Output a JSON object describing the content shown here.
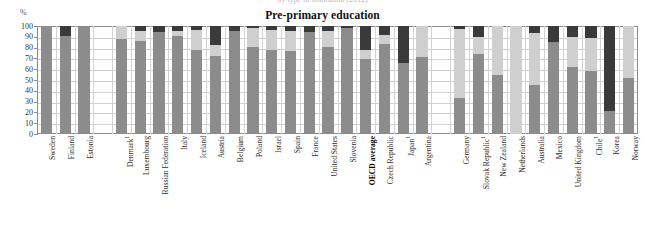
{
  "figure": {
    "top_caption_cutoff": "by type of institution (2012)",
    "title": "Pre-primary education",
    "y_axis_unit": "%"
  },
  "chart_data": {
    "type": "bar",
    "subtype": "stacked-bar",
    "title": "Pre-primary education",
    "xlabel": "",
    "ylabel": "%",
    "ylim": [
      0,
      100
    ],
    "yticks": [
      0,
      10,
      20,
      30,
      40,
      50,
      60,
      70,
      80,
      90,
      100
    ],
    "grid": true,
    "legend": null,
    "series": [
      {
        "name": "public-institutions",
        "color": "#8c8c8c"
      },
      {
        "name": "government-dependent-private",
        "color": "#cfcfcf"
      },
      {
        "name": "independent-private",
        "color": "#3a3a3a"
      }
    ],
    "categories": [
      "Sweden",
      "Finland",
      "Estonia",
      "Denmark",
      "Luxembourg",
      "Russian Federation",
      "Italy",
      "Iceland",
      "Austria",
      "Belgium",
      "Poland",
      "Israel",
      "Spain",
      "France",
      "United States",
      "Slovenia",
      "OECD average",
      "Czech Republic",
      "Japan",
      "Argentina",
      "Germany",
      "Slovak Republic",
      "New Zealand",
      "Netherlands",
      "Australia",
      "Mexico",
      "United Kingdom",
      "Chile",
      "Korea",
      "Norway"
    ],
    "category_footnotes": {
      "Denmark": "1",
      "Japan": "1",
      "Slovak Republic": "1",
      "Chile": "1"
    },
    "bold_categories": [
      "OECD average"
    ],
    "gap_after": [
      "Estonia",
      "Argentina"
    ],
    "values": [
      {
        "category": "Sweden",
        "public": 100,
        "gov_dependent_private": 0,
        "independent_private": 0
      },
      {
        "category": "Finland",
        "public": 91,
        "gov_dependent_private": 0,
        "independent_private": 9
      },
      {
        "category": "Estonia",
        "public": 100,
        "gov_dependent_private": 0,
        "independent_private": 0
      },
      {
        "category": "Denmark",
        "public": 88,
        "gov_dependent_private": 12,
        "independent_private": 0
      },
      {
        "category": "Luxembourg",
        "public": 86,
        "gov_dependent_private": 9,
        "independent_private": 5
      },
      {
        "category": "Russian Federation",
        "public": 94,
        "gov_dependent_private": 0,
        "independent_private": 6
      },
      {
        "category": "Italy",
        "public": 91,
        "gov_dependent_private": 4,
        "independent_private": 5
      },
      {
        "category": "Iceland",
        "public": 78,
        "gov_dependent_private": 18,
        "independent_private": 4
      },
      {
        "category": "Austria",
        "public": 72,
        "gov_dependent_private": 10,
        "independent_private": 18
      },
      {
        "category": "Belgium",
        "public": 95,
        "gov_dependent_private": 0,
        "independent_private": 5
      },
      {
        "category": "Poland",
        "public": 81,
        "gov_dependent_private": 17,
        "independent_private": 2
      },
      {
        "category": "Israel",
        "public": 78,
        "gov_dependent_private": 18,
        "independent_private": 4
      },
      {
        "category": "Spain",
        "public": 77,
        "gov_dependent_private": 18,
        "independent_private": 5
      },
      {
        "category": "France",
        "public": 94,
        "gov_dependent_private": 0,
        "independent_private": 6
      },
      {
        "category": "United States",
        "public": 81,
        "gov_dependent_private": 14,
        "independent_private": 5
      },
      {
        "category": "Slovenia",
        "public": 98,
        "gov_dependent_private": 0,
        "independent_private": 2
      },
      {
        "category": "OECD average",
        "public": 69,
        "gov_dependent_private": 9,
        "independent_private": 22
      },
      {
        "category": "Czech Republic",
        "public": 83,
        "gov_dependent_private": 9,
        "independent_private": 8
      },
      {
        "category": "Japan",
        "public": 66,
        "gov_dependent_private": 0,
        "independent_private": 34
      },
      {
        "category": "Argentina",
        "public": 71,
        "gov_dependent_private": 29,
        "independent_private": 0
      },
      {
        "category": "Germany",
        "public": 33,
        "gov_dependent_private": 64,
        "independent_private": 3
      },
      {
        "category": "Slovak Republic",
        "public": 74,
        "gov_dependent_private": 16,
        "independent_private": 10
      },
      {
        "category": "New Zealand",
        "public": 55,
        "gov_dependent_private": 45,
        "independent_private": 0
      },
      {
        "category": "Netherlands",
        "public": 0,
        "gov_dependent_private": 100,
        "independent_private": 0
      },
      {
        "category": "Australia",
        "public": 45,
        "gov_dependent_private": 49,
        "independent_private": 6
      },
      {
        "category": "Mexico",
        "public": 85,
        "gov_dependent_private": 0,
        "independent_private": 15
      },
      {
        "category": "United Kingdom",
        "public": 62,
        "gov_dependent_private": 28,
        "independent_private": 10
      },
      {
        "category": "Chile",
        "public": 58,
        "gov_dependent_private": 31,
        "independent_private": 11
      },
      {
        "category": "Korea",
        "public": 21,
        "gov_dependent_private": 0,
        "independent_private": 79
      },
      {
        "category": "Norway",
        "public": 52,
        "gov_dependent_private": 48,
        "independent_private": 0
      }
    ]
  }
}
